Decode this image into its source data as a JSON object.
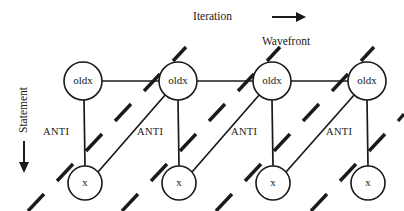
{
  "figure": {
    "background_color": "#ffffff",
    "ink_color": "#1a1a1a",
    "width": 404,
    "height": 211
  },
  "axes": {
    "horizontal": {
      "label": "Iteration",
      "arrow_direction": "right",
      "label_x": 232,
      "label_y": 17,
      "shaft_x1": 272,
      "shaft_x2": 296,
      "shaft_y": 17,
      "arrow_tip_x": 306
    },
    "vertical": {
      "label": "Statement",
      "arrow_direction": "down",
      "label_x": 24,
      "label_y": 110,
      "shaft_x": 24,
      "shaft_y1": 141,
      "shaft_y2": 162,
      "arrow_tip_y": 173
    }
  },
  "callout": {
    "label": "Wavefront",
    "x": 286,
    "y": 42
  },
  "nodes": {
    "radius_top": 19,
    "radius_bottom": 17,
    "top_row": [
      {
        "label": "oldx",
        "cx": 83,
        "cy": 81
      },
      {
        "label": "oldx",
        "cx": 178,
        "cy": 81
      },
      {
        "label": "oldx",
        "cx": 272,
        "cy": 81
      },
      {
        "label": "oldx",
        "cx": 367,
        "cy": 81
      }
    ],
    "bottom_row": [
      {
        "label": "x",
        "cx": 85,
        "cy": 183
      },
      {
        "label": "x",
        "cx": 179,
        "cy": 183
      },
      {
        "label": "x",
        "cx": 273,
        "cy": 183
      },
      {
        "label": "x",
        "cx": 368,
        "cy": 183
      }
    ]
  },
  "edges": {
    "horizontal": [
      {
        "x1": 102,
        "y1": 81,
        "x2": 159,
        "y2": 81
      },
      {
        "x1": 197,
        "y1": 81,
        "x2": 253,
        "y2": 81
      },
      {
        "x1": 291,
        "y1": 81,
        "x2": 348,
        "y2": 81
      }
    ],
    "vertical": [
      {
        "x1": 84,
        "y1": 100,
        "x2": 85,
        "y2": 166
      },
      {
        "x1": 178,
        "y1": 100,
        "x2": 179,
        "y2": 166
      },
      {
        "x1": 272,
        "y1": 100,
        "x2": 273,
        "y2": 166
      },
      {
        "x1": 367,
        "y1": 100,
        "x2": 368,
        "y2": 166
      }
    ],
    "diagonal": [
      {
        "x1": 98,
        "y1": 172,
        "x2": 166,
        "y2": 94
      },
      {
        "x1": 192,
        "y1": 172,
        "x2": 260,
        "y2": 94
      },
      {
        "x1": 286,
        "y1": 172,
        "x2": 355,
        "y2": 94
      }
    ]
  },
  "wavefront_lines": [
    {
      "name": "wavefront-1",
      "dashes": [
        {
          "x1": 28,
          "y1": 211,
          "x2": 44,
          "y2": 194
        },
        {
          "x1": 57,
          "y1": 181,
          "x2": 73,
          "y2": 164
        },
        {
          "x1": 86,
          "y1": 151,
          "x2": 102,
          "y2": 134
        },
        {
          "x1": 115,
          "y1": 121,
          "x2": 131,
          "y2": 104
        },
        {
          "x1": 144,
          "y1": 91,
          "x2": 160,
          "y2": 74
        },
        {
          "x1": 173,
          "y1": 61,
          "x2": 186,
          "y2": 47
        }
      ]
    },
    {
      "name": "wavefront-2",
      "dashes": [
        {
          "x1": 122,
          "y1": 211,
          "x2": 138,
          "y2": 194
        },
        {
          "x1": 151,
          "y1": 181,
          "x2": 167,
          "y2": 164
        },
        {
          "x1": 180,
          "y1": 151,
          "x2": 196,
          "y2": 134
        },
        {
          "x1": 209,
          "y1": 121,
          "x2": 225,
          "y2": 104
        },
        {
          "x1": 238,
          "y1": 91,
          "x2": 254,
          "y2": 74
        },
        {
          "x1": 267,
          "y1": 61,
          "x2": 280,
          "y2": 47
        }
      ]
    },
    {
      "name": "wavefront-3",
      "dashes": [
        {
          "x1": 216,
          "y1": 211,
          "x2": 232,
          "y2": 194
        },
        {
          "x1": 245,
          "y1": 181,
          "x2": 261,
          "y2": 164
        },
        {
          "x1": 274,
          "y1": 151,
          "x2": 290,
          "y2": 134
        },
        {
          "x1": 303,
          "y1": 121,
          "x2": 319,
          "y2": 104
        },
        {
          "x1": 332,
          "y1": 91,
          "x2": 348,
          "y2": 74
        },
        {
          "x1": 361,
          "y1": 61,
          "x2": 374,
          "y2": 47
        }
      ]
    },
    {
      "name": "wavefront-4",
      "dashes": [
        {
          "x1": 311,
          "y1": 211,
          "x2": 327,
          "y2": 194
        },
        {
          "x1": 340,
          "y1": 181,
          "x2": 356,
          "y2": 164
        },
        {
          "x1": 369,
          "y1": 151,
          "x2": 385,
          "y2": 134
        },
        {
          "x1": 398,
          "y1": 121,
          "x2": 404,
          "y2": 114
        }
      ]
    }
  ],
  "dependency_labels": [
    {
      "text": "ANTI",
      "x": 43,
      "y": 133
    },
    {
      "text": "ANTI",
      "x": 137,
      "y": 133
    },
    {
      "text": "ANTI",
      "x": 231,
      "y": 133
    },
    {
      "text": "ANTI",
      "x": 326,
      "y": 133
    }
  ]
}
